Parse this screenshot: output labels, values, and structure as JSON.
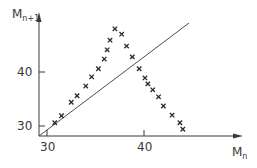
{
  "chart_data": {
    "type": "scatter",
    "title": "",
    "xlabel": "M_n",
    "ylabel": "M_n+1",
    "xlabel_parts": {
      "main": "M",
      "sub": "n"
    },
    "ylabel_parts": {
      "main": "M",
      "sub": "n+1"
    },
    "x_ticks": [
      30,
      40
    ],
    "y_ticks": [
      30,
      40
    ],
    "xlim": [
      29.2,
      49.0
    ],
    "ylim": [
      28.2,
      50.5
    ],
    "grid": false,
    "legend": null,
    "marker": "x",
    "reference_line": {
      "label": "y = x",
      "from": [
        29.2,
        28.2
      ],
      "to": [
        44.6,
        49.0
      ]
    },
    "series": [
      {
        "name": "maxima",
        "x": [
          30.8,
          31.5,
          32.5,
          33.1,
          34.0,
          34.6,
          35.3,
          35.9,
          36.2,
          36.5,
          37.0,
          37.7,
          38.2,
          38.8,
          39.5,
          40.1,
          40.4,
          40.9,
          41.5,
          42.0,
          42.9,
          43.7,
          44.0
        ],
        "y": [
          30.6,
          31.9,
          34.4,
          35.6,
          37.4,
          39.1,
          40.6,
          42.4,
          44.1,
          45.9,
          48.0,
          47.0,
          44.8,
          42.8,
          40.6,
          38.9,
          37.8,
          36.7,
          35.4,
          33.7,
          32.0,
          30.6,
          29.4
        ]
      }
    ],
    "colors": {
      "ink": "#3a3a3a",
      "background": "#ffffff"
    }
  },
  "axes": {
    "x_tick_labels": [
      "30",
      "40"
    ],
    "y_tick_labels": [
      "30",
      "40"
    ]
  }
}
